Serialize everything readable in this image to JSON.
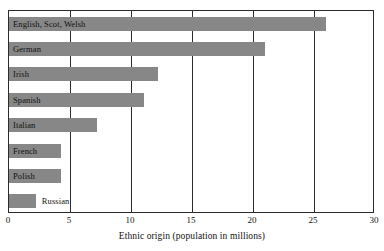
{
  "chart_data": {
    "type": "bar",
    "orientation": "horizontal",
    "title": "",
    "xlabel": "Ethnic origin (population in millions)",
    "ylabel": "",
    "xlim": [
      0,
      30
    ],
    "xticks": [
      0,
      5,
      10,
      15,
      20,
      25,
      30
    ],
    "xtick_labels": [
      "0",
      "5",
      "10",
      "15",
      "20",
      "25",
      "30"
    ],
    "grid": true,
    "grid_axis": "x",
    "legend": false,
    "bar_color": "#878787",
    "frame_color": "#2b2b2b",
    "categories": [
      "English, Scot, Welsh",
      "German",
      "Irish",
      "Spanish",
      "Italian",
      "French",
      "Polish",
      "Russian"
    ],
    "values": [
      26,
      21,
      12.2,
      11.1,
      7.2,
      4.3,
      4.3,
      2.2
    ],
    "label_placement": [
      "inside",
      "inside",
      "inside",
      "inside",
      "inside",
      "inside",
      "inside",
      "outside"
    ]
  }
}
